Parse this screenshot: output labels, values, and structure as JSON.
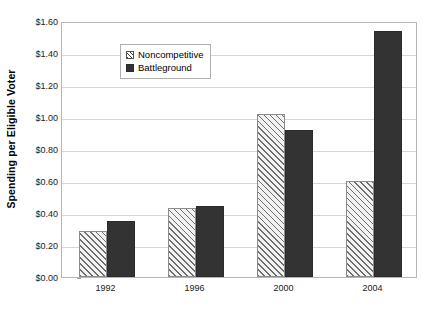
{
  "chart_data": {
    "type": "bar",
    "title": "",
    "subtitle": "",
    "xlabel": "",
    "ylabel": "Spending per Eligible Voter",
    "categories": [
      "1992",
      "1996",
      "2000",
      "2004"
    ],
    "series": [
      {
        "name": "Noncompetitive",
        "values": [
          0.29,
          0.43,
          1.02,
          0.6
        ],
        "fill": "diagonal-hatch",
        "color": "#f2f2f2"
      },
      {
        "name": "Battleground",
        "values": [
          0.35,
          0.445,
          0.92,
          1.54
        ],
        "fill": "solid",
        "color": "#333333"
      }
    ],
    "ylim": [
      0,
      1.6
    ],
    "ytick_values": [
      0.0,
      0.2,
      0.4,
      0.6,
      0.8,
      1.0,
      1.2,
      1.4,
      1.6
    ],
    "ytick_labels": [
      "$0.00",
      "$0.20",
      "$0.40",
      "$0.60",
      "$0.80",
      "$1.00",
      "$1.20",
      "$1.40",
      "$1.60"
    ],
    "grid": "horizontal",
    "legend_position": "upper-left-inside",
    "legend_entries": [
      "Noncompetitive",
      "Battleground"
    ],
    "annotations": []
  },
  "axis": {
    "y_title": "Spending per Eligible Voter"
  },
  "legend": {
    "items": [
      {
        "label": "Noncompetitive"
      },
      {
        "label": "Battleground"
      }
    ]
  }
}
